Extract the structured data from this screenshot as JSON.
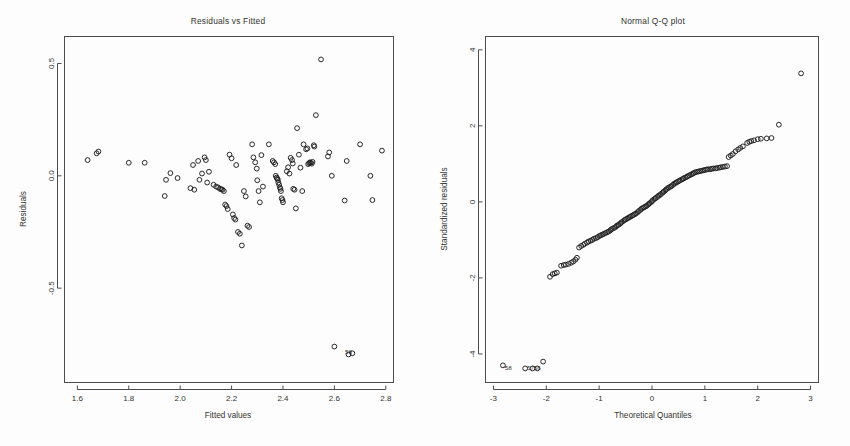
{
  "figure": {
    "background": "#fdfdfd",
    "point_color": "#1d1d1d",
    "axis_color": "#4c4c4c",
    "panels": 2
  },
  "chart_data": [
    {
      "type": "scatter",
      "title": "Residuals vs Fitted",
      "xlabel": "Fitted values",
      "ylabel": "Residuals",
      "xlim": [
        1.55,
        2.83
      ],
      "ylim": [
        -0.92,
        0.62
      ],
      "xticks": [
        "1.6",
        "1.8",
        "2.0",
        "2.2",
        "2.4",
        "2.6",
        "2.8"
      ],
      "xtickvals": [
        1.6,
        1.8,
        2.0,
        2.2,
        2.4,
        2.6,
        2.8
      ],
      "yticks": [
        "0.5",
        "0.0",
        "-0.5"
      ],
      "ytickvals": [
        0.5,
        0.0,
        -0.5
      ],
      "grid": false,
      "legend": "none",
      "marker": "open-circle",
      "annotations": [
        {
          "text": "58",
          "x": 2.655,
          "y": -0.795
        }
      ],
      "points": [
        [
          1.64,
          0.07
        ],
        [
          1.675,
          0.1
        ],
        [
          1.682,
          0.108
        ],
        [
          1.8,
          0.058
        ],
        [
          1.862,
          0.058
        ],
        [
          1.94,
          -0.09
        ],
        [
          1.945,
          -0.018
        ],
        [
          1.962,
          0.012
        ],
        [
          1.99,
          -0.01
        ],
        [
          2.04,
          -0.055
        ],
        [
          2.05,
          0.048
        ],
        [
          2.055,
          -0.062
        ],
        [
          2.07,
          0.066
        ],
        [
          2.075,
          -0.018
        ],
        [
          2.085,
          0.01
        ],
        [
          2.095,
          0.082
        ],
        [
          2.1,
          0.07
        ],
        [
          2.105,
          -0.03
        ],
        [
          2.112,
          0.018
        ],
        [
          2.13,
          -0.04
        ],
        [
          2.14,
          -0.048
        ],
        [
          2.148,
          -0.052
        ],
        [
          2.155,
          -0.058
        ],
        [
          2.16,
          -0.06
        ],
        [
          2.165,
          -0.062
        ],
        [
          2.17,
          -0.068
        ],
        [
          2.175,
          -0.128
        ],
        [
          2.18,
          -0.135
        ],
        [
          2.185,
          -0.148
        ],
        [
          2.192,
          0.094
        ],
        [
          2.2,
          0.078
        ],
        [
          2.205,
          -0.172
        ],
        [
          2.21,
          -0.188
        ],
        [
          2.215,
          -0.195
        ],
        [
          2.218,
          0.048
        ],
        [
          2.225,
          -0.25
        ],
        [
          2.232,
          -0.258
        ],
        [
          2.24,
          -0.31
        ],
        [
          2.248,
          -0.068
        ],
        [
          2.255,
          -0.092
        ],
        [
          2.262,
          -0.222
        ],
        [
          2.268,
          -0.228
        ],
        [
          2.28,
          0.14
        ],
        [
          2.285,
          0.082
        ],
        [
          2.292,
          0.06
        ],
        [
          2.298,
          0.032
        ],
        [
          2.3,
          -0.02
        ],
        [
          2.305,
          -0.068
        ],
        [
          2.31,
          -0.118
        ],
        [
          2.316,
          0.092
        ],
        [
          2.322,
          -0.048
        ],
        [
          2.345,
          0.14
        ],
        [
          2.36,
          0.066
        ],
        [
          2.365,
          0.06
        ],
        [
          2.37,
          0.052
        ],
        [
          2.372,
          0.0
        ],
        [
          2.375,
          -0.008
        ],
        [
          2.378,
          -0.012
        ],
        [
          2.38,
          -0.018
        ],
        [
          2.382,
          -0.03
        ],
        [
          2.385,
          -0.04
        ],
        [
          2.388,
          -0.052
        ],
        [
          2.39,
          -0.058
        ],
        [
          2.392,
          -0.068
        ],
        [
          2.395,
          -0.1
        ],
        [
          2.398,
          -0.108
        ],
        [
          2.4,
          -0.118
        ],
        [
          2.415,
          0.02
        ],
        [
          2.42,
          0.038
        ],
        [
          2.425,
          0.01
        ],
        [
          2.43,
          0.08
        ],
        [
          2.435,
          0.07
        ],
        [
          2.438,
          0.055
        ],
        [
          2.44,
          -0.058
        ],
        [
          2.445,
          -0.062
        ],
        [
          2.45,
          -0.145
        ],
        [
          2.455,
          0.212
        ],
        [
          2.462,
          0.094
        ],
        [
          2.468,
          0.036
        ],
        [
          2.475,
          -0.068
        ],
        [
          2.48,
          0.14
        ],
        [
          2.49,
          0.118
        ],
        [
          2.495,
          0.122
        ],
        [
          2.498,
          0.052
        ],
        [
          2.502,
          0.056
        ],
        [
          2.505,
          0.06
        ],
        [
          2.508,
          0.058
        ],
        [
          2.512,
          0.054
        ],
        [
          2.515,
          0.062
        ],
        [
          2.52,
          0.136
        ],
        [
          2.522,
          0.13
        ],
        [
          2.528,
          0.27
        ],
        [
          2.548,
          0.518
        ],
        [
          2.575,
          0.086
        ],
        [
          2.58,
          0.104
        ],
        [
          2.59,
          0.0
        ],
        [
          2.6,
          -0.76
        ],
        [
          2.64,
          -0.11
        ],
        [
          2.648,
          0.066
        ],
        [
          2.655,
          -0.795
        ],
        [
          2.67,
          -0.79
        ],
        [
          2.7,
          0.14
        ],
        [
          2.74,
          0.0
        ],
        [
          2.748,
          -0.108
        ],
        [
          2.785,
          0.112
        ]
      ]
    },
    {
      "type": "scatter",
      "title": "Normal Q-Q plot",
      "xlabel": "Theoretical Quantiles",
      "ylabel": "Standardized residuals",
      "xlim": [
        -3.15,
        3.15
      ],
      "ylim": [
        -4.75,
        4.35
      ],
      "xticks": [
        "-3",
        "-2",
        "-1",
        "0",
        "1",
        "2",
        "3"
      ],
      "xtickvals": [
        -3,
        -2,
        -1,
        0,
        1,
        2,
        3
      ],
      "yticks": [
        "4",
        "2",
        "0",
        "-2",
        "-4"
      ],
      "ytickvals": [
        4,
        2,
        0,
        -2,
        -4
      ],
      "grid": false,
      "legend": "none",
      "marker": "open-circle",
      "annotations": [
        {
          "text": "58",
          "x": -2.72,
          "y": -4.42
        },
        {
          "text": "57",
          "x": -2.3,
          "y": -4.42
        },
        {
          "text": "56",
          "x": -2.17,
          "y": -4.42
        }
      ],
      "points": [
        [
          -2.82,
          -4.3
        ],
        [
          -2.4,
          -4.38
        ],
        [
          -2.26,
          -4.38
        ],
        [
          -2.17,
          -4.38
        ],
        [
          -2.06,
          -4.2
        ],
        [
          -1.93,
          -1.97
        ],
        [
          -1.88,
          -1.9
        ],
        [
          -1.84,
          -1.88
        ],
        [
          -1.8,
          -1.86
        ],
        [
          -1.72,
          -1.68
        ],
        [
          -1.67,
          -1.66
        ],
        [
          -1.63,
          -1.65
        ],
        [
          -1.58,
          -1.63
        ],
        [
          -1.53,
          -1.6
        ],
        [
          -1.49,
          -1.57
        ],
        [
          -1.45,
          -1.52
        ],
        [
          -1.42,
          -1.47
        ],
        [
          -1.38,
          -1.2
        ],
        [
          -1.34,
          -1.16
        ],
        [
          -1.3,
          -1.13
        ],
        [
          -1.27,
          -1.1
        ],
        [
          -1.23,
          -1.07
        ],
        [
          -1.2,
          -1.04
        ],
        [
          -1.16,
          -1.02
        ],
        [
          -1.13,
          -1.0
        ],
        [
          -1.1,
          -0.97
        ],
        [
          -1.06,
          -0.95
        ],
        [
          -1.03,
          -0.93
        ],
        [
          -1.0,
          -0.9
        ],
        [
          -0.97,
          -0.88
        ],
        [
          -0.94,
          -0.86
        ],
        [
          -0.91,
          -0.84
        ],
        [
          -0.88,
          -0.82
        ],
        [
          -0.85,
          -0.8
        ],
        [
          -0.82,
          -0.78
        ],
        [
          -0.79,
          -0.75
        ],
        [
          -0.77,
          -0.72
        ],
        [
          -0.74,
          -0.7
        ],
        [
          -0.71,
          -0.68
        ],
        [
          -0.68,
          -0.65
        ],
        [
          -0.66,
          -0.62
        ],
        [
          -0.63,
          -0.6
        ],
        [
          -0.6,
          -0.57
        ],
        [
          -0.58,
          -0.54
        ],
        [
          -0.55,
          -0.51
        ],
        [
          -0.52,
          -0.48
        ],
        [
          -0.5,
          -0.46
        ],
        [
          -0.47,
          -0.44
        ],
        [
          -0.45,
          -0.42
        ],
        [
          -0.42,
          -0.4
        ],
        [
          -0.4,
          -0.38
        ],
        [
          -0.37,
          -0.36
        ],
        [
          -0.35,
          -0.34
        ],
        [
          -0.32,
          -0.32
        ],
        [
          -0.3,
          -0.3
        ],
        [
          -0.27,
          -0.27
        ],
        [
          -0.25,
          -0.24
        ],
        [
          -0.22,
          -0.21
        ],
        [
          -0.2,
          -0.18
        ],
        [
          -0.17,
          -0.16
        ],
        [
          -0.15,
          -0.14
        ],
        [
          -0.12,
          -0.12
        ],
        [
          -0.1,
          -0.1
        ],
        [
          -0.07,
          -0.07
        ],
        [
          -0.05,
          -0.04
        ],
        [
          -0.02,
          -0.01
        ],
        [
          0.0,
          0.02
        ],
        [
          0.02,
          0.05
        ],
        [
          0.05,
          0.08
        ],
        [
          0.07,
          0.1
        ],
        [
          0.1,
          0.13
        ],
        [
          0.12,
          0.16
        ],
        [
          0.15,
          0.18
        ],
        [
          0.17,
          0.21
        ],
        [
          0.2,
          0.24
        ],
        [
          0.22,
          0.27
        ],
        [
          0.25,
          0.3
        ],
        [
          0.27,
          0.33
        ],
        [
          0.3,
          0.36
        ],
        [
          0.32,
          0.38
        ],
        [
          0.35,
          0.4
        ],
        [
          0.37,
          0.42
        ],
        [
          0.4,
          0.45
        ],
        [
          0.42,
          0.48
        ],
        [
          0.45,
          0.5
        ],
        [
          0.47,
          0.52
        ],
        [
          0.5,
          0.54
        ],
        [
          0.52,
          0.56
        ],
        [
          0.55,
          0.58
        ],
        [
          0.58,
          0.6
        ],
        [
          0.6,
          0.62
        ],
        [
          0.63,
          0.64
        ],
        [
          0.66,
          0.66
        ],
        [
          0.68,
          0.68
        ],
        [
          0.71,
          0.7
        ],
        [
          0.74,
          0.72
        ],
        [
          0.77,
          0.74
        ],
        [
          0.79,
          0.76
        ],
        [
          0.82,
          0.78
        ],
        [
          0.85,
          0.79
        ],
        [
          0.88,
          0.8
        ],
        [
          0.91,
          0.81
        ],
        [
          0.94,
          0.82
        ],
        [
          0.97,
          0.83
        ],
        [
          1.0,
          0.84
        ],
        [
          1.03,
          0.85
        ],
        [
          1.06,
          0.86
        ],
        [
          1.1,
          0.86
        ],
        [
          1.13,
          0.87
        ],
        [
          1.16,
          0.88
        ],
        [
          1.2,
          0.88
        ],
        [
          1.23,
          0.89
        ],
        [
          1.27,
          0.9
        ],
        [
          1.3,
          0.91
        ],
        [
          1.34,
          0.92
        ],
        [
          1.38,
          0.93
        ],
        [
          1.42,
          0.94
        ],
        [
          1.45,
          1.18
        ],
        [
          1.49,
          1.22
        ],
        [
          1.53,
          1.26
        ],
        [
          1.58,
          1.33
        ],
        [
          1.63,
          1.38
        ],
        [
          1.67,
          1.42
        ],
        [
          1.72,
          1.46
        ],
        [
          1.8,
          1.55
        ],
        [
          1.84,
          1.58
        ],
        [
          1.88,
          1.6
        ],
        [
          1.93,
          1.62
        ],
        [
          2.0,
          1.65
        ],
        [
          2.06,
          1.66
        ],
        [
          2.17,
          1.67
        ],
        [
          2.26,
          1.68
        ],
        [
          2.4,
          2.03
        ],
        [
          2.82,
          3.38
        ]
      ]
    }
  ]
}
